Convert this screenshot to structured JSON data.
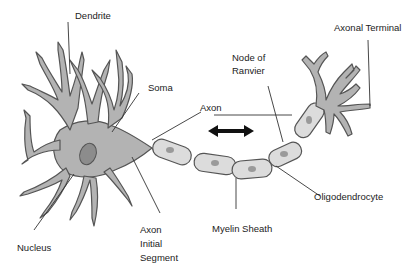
{
  "diagram": {
    "colors": {
      "cell_fill": "#b3b3b3",
      "cell_stroke": "#555555",
      "myelin_fill": "#dcdcdc",
      "myelin_nucleus": "#9a9a9a",
      "nucleus_fill": "#8c8c8c",
      "leader_line": "#333333",
      "arrow": "#111111",
      "text": "#222222"
    },
    "labels": {
      "dendrite": "Dendrite",
      "soma": "Soma",
      "axon": "Axon",
      "node_of_ranvier_line1": "Node of",
      "node_of_ranvier_line2": "Ranvier",
      "axonal_terminal": "Axonal Terminal",
      "nucleus": "Nucleus",
      "axon_initial_segment_line1": "Axon",
      "axon_initial_segment_line2": "Initial",
      "axon_initial_segment_line3": "Segment",
      "myelin_sheath": "Myelin Sheath",
      "oligodendrocyte": "Oligodendrocyte"
    },
    "icons": {
      "signal_direction": "double-headed-arrow"
    }
  }
}
